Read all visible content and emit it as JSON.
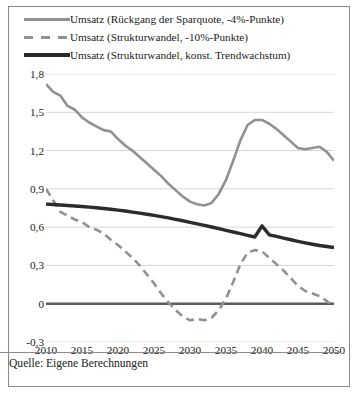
{
  "legend": {
    "items": [
      {
        "label": "Umsatz (Rückgang der Sparquote, -4%-Punkte)",
        "style": "solid-gray",
        "color": "#919191"
      },
      {
        "label": "Umsatz (Strukturwandel, -10%-Punkte)",
        "style": "dashed-gray",
        "color": "#919191"
      },
      {
        "label": "Umsatz (Strukturwandel, konst. Trendwachstum)",
        "style": "solid-black",
        "color": "#2b2b2b"
      }
    ]
  },
  "footer": {
    "source": "Quelle: Eigene Berechnungen"
  },
  "axis": {
    "y_ticks": [
      "1,8",
      "1,5",
      "1,2",
      "0,9",
      "0,6",
      "0,3",
      "0",
      "-0,3"
    ],
    "x_ticks": [
      "2010",
      "2015",
      "2020",
      "2025",
      "2030",
      "2035",
      "2040",
      "2045",
      "2050"
    ]
  },
  "chart_data": {
    "type": "line",
    "title": "",
    "subtitle": "",
    "xlabel": "",
    "ylabel": "",
    "xlim": [
      2010,
      2050
    ],
    "ylim": [
      -0.3,
      1.8
    ],
    "y_ticks": [
      1.8,
      1.5,
      1.2,
      0.9,
      0.6,
      0.3,
      0,
      -0.3
    ],
    "x_ticks": [
      2010,
      2015,
      2020,
      2025,
      2030,
      2035,
      2040,
      2045,
      2050
    ],
    "grid": true,
    "zero_line": true,
    "legend_position": "top",
    "source_note": "Quelle: Eigene Berechnungen",
    "x": [
      2010,
      2011,
      2012,
      2013,
      2014,
      2015,
      2016,
      2017,
      2018,
      2019,
      2020,
      2021,
      2022,
      2023,
      2024,
      2025,
      2026,
      2027,
      2028,
      2029,
      2030,
      2031,
      2032,
      2033,
      2034,
      2035,
      2036,
      2037,
      2038,
      2039,
      2040,
      2041,
      2042,
      2043,
      2044,
      2045,
      2046,
      2047,
      2048,
      2049,
      2050
    ],
    "series": [
      {
        "name": "Umsatz (Rückgang der Sparquote, -4%-Punkte)",
        "style": "solid",
        "color": "#919191",
        "values": [
          1.72,
          1.66,
          1.63,
          1.55,
          1.52,
          1.46,
          1.42,
          1.39,
          1.36,
          1.35,
          1.29,
          1.24,
          1.2,
          1.15,
          1.1,
          1.05,
          1.0,
          0.94,
          0.89,
          0.84,
          0.8,
          0.78,
          0.77,
          0.79,
          0.86,
          0.97,
          1.12,
          1.28,
          1.4,
          1.44,
          1.44,
          1.41,
          1.37,
          1.32,
          1.27,
          1.22,
          1.21,
          1.22,
          1.23,
          1.19,
          1.12
        ]
      },
      {
        "name": "Umsatz (Strukturwandel, -10%-Punkte)",
        "style": "dashed",
        "color": "#919191",
        "values": [
          0.9,
          0.81,
          0.72,
          0.69,
          0.66,
          0.64,
          0.6,
          0.58,
          0.55,
          0.5,
          0.46,
          0.41,
          0.36,
          0.3,
          0.23,
          0.16,
          0.08,
          0.01,
          -0.05,
          -0.1,
          -0.13,
          -0.12,
          -0.13,
          -0.11,
          -0.05,
          0.04,
          0.17,
          0.31,
          0.4,
          0.42,
          0.41,
          0.36,
          0.31,
          0.26,
          0.2,
          0.14,
          0.1,
          0.08,
          0.06,
          0.02,
          -0.02
        ]
      },
      {
        "name": "Umsatz (Strukturwandel, konst. Trendwachstum)",
        "style": "solid-thick",
        "color": "#2b2b2b",
        "values": [
          0.78,
          0.777,
          0.774,
          0.77,
          0.766,
          0.762,
          0.757,
          0.752,
          0.746,
          0.74,
          0.733,
          0.726,
          0.718,
          0.71,
          0.701,
          0.692,
          0.682,
          0.672,
          0.661,
          0.65,
          0.638,
          0.626,
          0.614,
          0.601,
          0.588,
          0.575,
          0.562,
          0.549,
          0.536,
          0.523,
          0.61,
          0.54,
          0.527,
          0.514,
          0.501,
          0.489,
          0.477,
          0.466,
          0.456,
          0.448,
          0.44
        ]
      }
    ]
  }
}
